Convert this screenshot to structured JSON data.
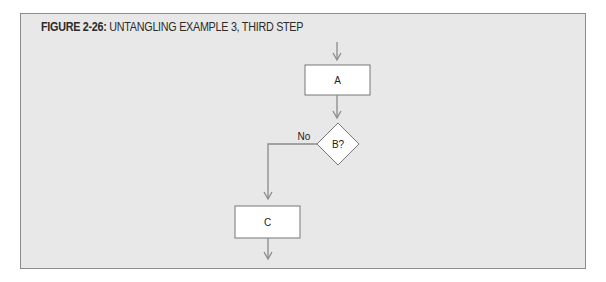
{
  "figure": {
    "number_label": "FIGURE 2-26:",
    "title": "UNTANGLING EXAMPLE 3, THIRD STEP"
  },
  "diagram": {
    "nodes": [
      {
        "id": "A",
        "type": "process",
        "label": "A"
      },
      {
        "id": "B",
        "type": "decision",
        "label": "B?"
      },
      {
        "id": "C",
        "type": "process",
        "label": "C"
      }
    ],
    "edges": [
      {
        "from": "entry",
        "to": "A",
        "label": ""
      },
      {
        "from": "A",
        "to": "B",
        "label": ""
      },
      {
        "from": "B",
        "to": "C",
        "label": "No"
      },
      {
        "from": "C",
        "to": "exit",
        "label": ""
      }
    ],
    "colors": {
      "panel_bg": "#e8e8e8",
      "panel_border": "#8c8c8c",
      "node_fill": "#ffffff",
      "node_stroke": "#777777",
      "arrow": "#8a8a8a"
    }
  }
}
